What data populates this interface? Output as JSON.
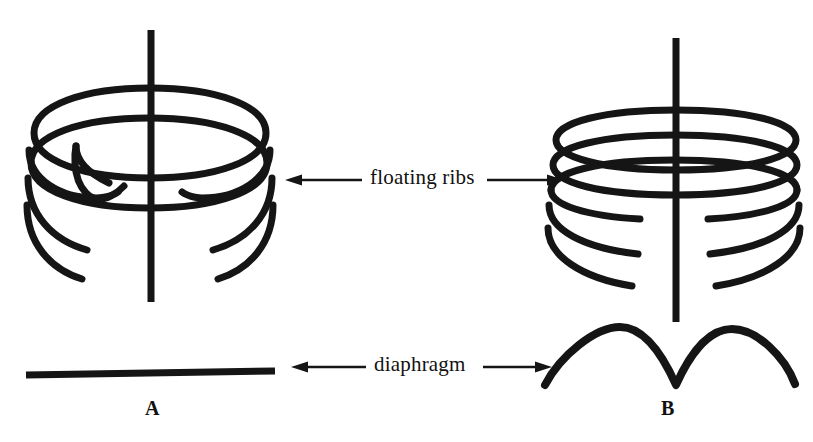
{
  "figure": {
    "background_color": "#ffffff",
    "ink_color": "#151515",
    "width": 813,
    "height": 442
  },
  "annotations": {
    "floating_ribs": {
      "label": "floating ribs",
      "left_arrow_icon": "arrow-left-icon",
      "right_arrow_icon": "arrow-right-icon"
    },
    "diaphragm": {
      "label": "diaphragm",
      "left_arrow_icon": "arrow-left-icon",
      "right_arrow_icon": "arrow-right-icon"
    }
  },
  "panels": [
    {
      "id": "A",
      "caption": "A",
      "spine_label": "vertical-spine",
      "rib_count": 5,
      "diaphragm_shape": "flat",
      "rib_style": "narrow-arcs-with-free-ends"
    },
    {
      "id": "B",
      "caption": "B",
      "spine_label": "vertical-spine",
      "rib_count": 5,
      "diaphragm_shape": "double-dome",
      "rib_style": "wide-flat-arcs-meeting-spine"
    }
  ]
}
